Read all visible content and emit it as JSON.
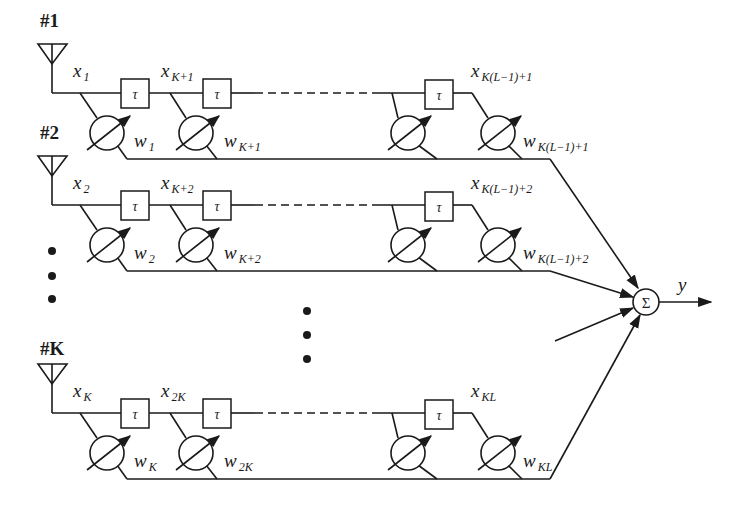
{
  "rows": [
    {
      "antenna_label": "#1",
      "taps": [
        {
          "x": "x",
          "x_sub": "1",
          "w": "w",
          "w_sub": "1"
        },
        {
          "x": "x",
          "x_sub": "K+1",
          "w": "w",
          "w_sub": "K+1"
        },
        {
          "x": "",
          "x_sub": "",
          "w": "",
          "w_sub": ""
        },
        {
          "x": "x",
          "x_sub": "K(L−1)+1",
          "w": "w",
          "w_sub": "K(L−1)+1"
        }
      ]
    },
    {
      "antenna_label": "#2",
      "taps": [
        {
          "x": "x",
          "x_sub": "2",
          "w": "w",
          "w_sub": "2"
        },
        {
          "x": "x",
          "x_sub": "K+2",
          "w": "w",
          "w_sub": "K+2"
        },
        {
          "x": "",
          "x_sub": "",
          "w": "",
          "w_sub": ""
        },
        {
          "x": "x",
          "x_sub": "K(L−1)+2",
          "w": "w",
          "w_sub": "K(L−1)+2"
        }
      ]
    },
    {
      "antenna_label": "#K",
      "taps": [
        {
          "x": "x",
          "x_sub": "K",
          "w": "w",
          "w_sub": "K"
        },
        {
          "x": "x",
          "x_sub": "2K",
          "w": "w",
          "w_sub": "2K"
        },
        {
          "x": "",
          "x_sub": "",
          "w": "",
          "w_sub": ""
        },
        {
          "x": "x",
          "x_sub": "KL",
          "w": "w",
          "w_sub": "KL"
        }
      ]
    }
  ],
  "delay_label": "τ",
  "summer_label": "Σ",
  "output_label": "y",
  "ellipsis_marker": "⋮"
}
